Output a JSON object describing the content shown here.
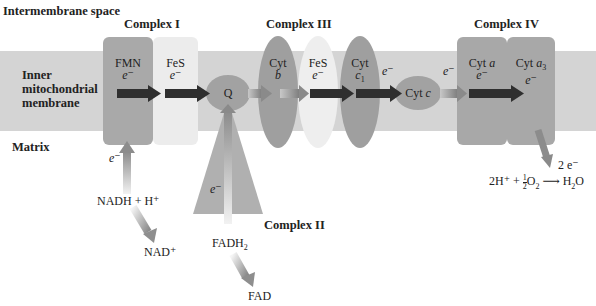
{
  "regions": {
    "intermembrane": "Intermembrane space",
    "membrane_line1": "Inner",
    "membrane_line2": "mitochondrial",
    "membrane_line3": "membrane",
    "matrix": "Matrix"
  },
  "complexes": {
    "c1": "Complex I",
    "c2": "Complex II",
    "c3": "Complex III",
    "c4": "Complex IV"
  },
  "carriers": {
    "fmn": "FMN",
    "fes1": "FeS",
    "q": "Q",
    "cytb_1": "Cyt",
    "cytb_2": "b",
    "fes3": "FeS",
    "cytc1_1": "Cyt",
    "cytc1_2": "c",
    "cytc1_sub": "1",
    "cytc": "Cyt ",
    "cytc_it": "c",
    "cyta": "Cyt ",
    "cyta_it": "a",
    "cyta3": "Cyt ",
    "cyta3_it": "a",
    "cyta3_sub": "3"
  },
  "electron": "e⁻",
  "substrates": {
    "nadh": "NADH + H⁺",
    "nad": "NAD⁺",
    "fadh2": "FADH",
    "fadh2_sub": "2",
    "fad": "FAD",
    "two_e": "2 e⁻",
    "reaction_left": "2H⁺ + ",
    "reaction_frac_num": "1",
    "reaction_frac_den": "2",
    "reaction_o2": "O",
    "reaction_o2_sub": "2",
    "reaction_arrow": " ⟶ ",
    "reaction_h2o": "H",
    "reaction_h2o_sub": "2",
    "reaction_h2o_end": "O"
  },
  "colors": {
    "membrane": "#d6d6d6",
    "complex_gray": "#a8a8a8",
    "fes_light": "#ececec",
    "arrow_dark": "#2e2e2e",
    "arrow_mid": "#8a8a8a"
  }
}
